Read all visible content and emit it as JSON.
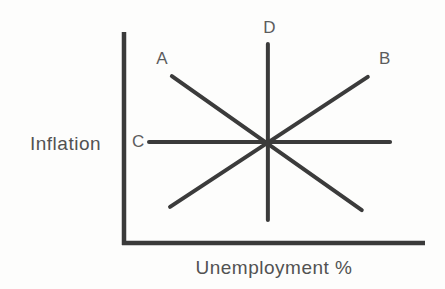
{
  "figure": {
    "ylabel": "Inflation",
    "xlabel": "Unemployment %",
    "background": "#fdfdfc",
    "text_color": "#525252"
  },
  "chart_data": {
    "type": "line",
    "title": "",
    "xlabel": "Unemployment %",
    "ylabel": "Inflation",
    "axis_ranges": {
      "x": [
        0,
        1
      ],
      "y": [
        0,
        1
      ]
    },
    "grid": false,
    "tick_labels": "none",
    "legend": "none",
    "intersection": [
      0.478,
      0.479
    ],
    "series": [
      {
        "name": "A",
        "shape": "downward-sloping line",
        "points": [
          [
            0.159,
            0.791
          ],
          [
            0.79,
            0.156
          ]
        ],
        "label_pos": [
          0.126,
          0.873
        ]
      },
      {
        "name": "B",
        "shape": "upward-sloping line",
        "points": [
          [
            0.153,
            0.171
          ],
          [
            0.81,
            0.787
          ]
        ],
        "label_pos": [
          0.866,
          0.873
        ]
      },
      {
        "name": "C",
        "shape": "horizontal line",
        "points": [
          [
            0.083,
            0.479
          ],
          [
            0.884,
            0.479
          ]
        ],
        "label_pos": [
          0.047,
          0.482
        ]
      },
      {
        "name": "D",
        "shape": "vertical line",
        "points": [
          [
            0.478,
            0.109
          ],
          [
            0.478,
            0.943
          ]
        ],
        "label_pos": [
          0.483,
          1.02
        ]
      }
    ],
    "line_color": "#3b3b3b",
    "line_width_px": 4,
    "line_cap": "round",
    "label_color": "#5c5c5c",
    "label_font_px": 17,
    "plot_area_px": {
      "left": 124,
      "right": 425,
      "top": 32,
      "bottom": 243
    },
    "axes_px": {
      "y_axis": {
        "x": 124,
        "y1": 32,
        "y2": 245
      },
      "x_axis": {
        "y": 243,
        "x1": 122,
        "x2": 425
      },
      "color": "#3a3a3a",
      "width_px": 4.5
    }
  }
}
